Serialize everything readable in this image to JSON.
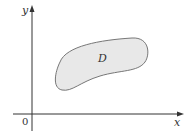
{
  "diagram": {
    "axes": {
      "x_label": "x",
      "y_label": "y",
      "origin_label": "0"
    },
    "region": {
      "label": "D",
      "fill": "#e8e8e8",
      "stroke": "#777777"
    },
    "axis_color": "#333333"
  }
}
